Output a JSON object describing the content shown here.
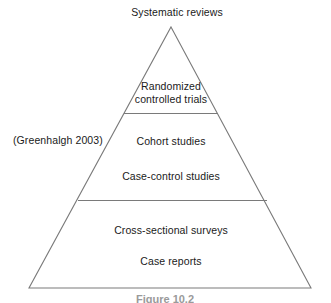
{
  "figure": {
    "type": "evidence-hierarchy-pyramid",
    "citation": "(Greenhalgh 2003)",
    "caption": "Figure 10.2",
    "stroke_color": "#7a7a7a",
    "text_color": "#1a1a1a",
    "background_color": "#ffffff"
  },
  "apex_label": {
    "text": "Systematic reviews"
  },
  "levels": [
    {
      "id": "randomized-controlled-trials",
      "label": "Randomized controlled trials",
      "line1": "Randomized",
      "line2": "controlled trials",
      "rank": 1
    },
    {
      "id": "cohort-studies",
      "label": "Cohort studies",
      "rank": 2
    },
    {
      "id": "case-control-studies",
      "label": "Case-control studies",
      "rank": 3
    },
    {
      "id": "cross-sectional-surveys",
      "label": "Cross-sectional surveys",
      "rank": 4
    },
    {
      "id": "case-reports",
      "label": "Case reports",
      "rank": 5
    }
  ],
  "geometry": {
    "apex_x": 171,
    "apex_y": 27,
    "base_left_x": 29,
    "base_right_x": 311,
    "base_y": 288,
    "divider_1_y": 113,
    "divider_1_x1": 124,
    "divider_1_x2": 218,
    "divider_2_y": 200,
    "divider_2_x1": 78,
    "divider_2_x2": 267
  }
}
